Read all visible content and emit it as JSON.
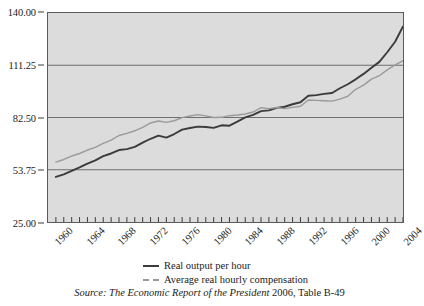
{
  "chart_data": {
    "type": "line",
    "title": "",
    "subtitle": "",
    "xlabel": "",
    "ylabel": "",
    "xlim": [
      1959,
      2004
    ],
    "ylim": [
      25.0,
      140.0
    ],
    "grid": true,
    "grid_axis": "y",
    "legend_position": "below-plot-center",
    "y_ticks": [
      "140.00",
      "111.25",
      "82.50",
      "53.75",
      "25.00"
    ],
    "y_tick_values": [
      140.0,
      111.25,
      82.5,
      53.75,
      25.0
    ],
    "x_ticks": [
      "1960",
      "1964",
      "1968",
      "1972",
      "1976",
      "1980",
      "1984",
      "1988",
      "1992",
      "1996",
      "2000",
      "2004"
    ],
    "x_tick_values": [
      1960,
      1964,
      1968,
      1972,
      1976,
      1980,
      1984,
      1988,
      1992,
      1996,
      2000,
      2004
    ],
    "x_minor_tick_interval": 1,
    "x": [
      1960,
      1961,
      1962,
      1963,
      1964,
      1965,
      1966,
      1967,
      1968,
      1969,
      1970,
      1971,
      1972,
      1973,
      1974,
      1975,
      1976,
      1977,
      1978,
      1979,
      1980,
      1981,
      1982,
      1983,
      1984,
      1985,
      1986,
      1987,
      1988,
      1989,
      1990,
      1991,
      1992,
      1993,
      1994,
      1995,
      1996,
      1997,
      1998,
      1999,
      2000,
      2001,
      2002,
      2003,
      2004
    ],
    "series": [
      {
        "name": "Real output per hour",
        "color": "#3b3b3b",
        "style": "solid",
        "values": [
          49.8,
          51.2,
          53.1,
          55.0,
          57.1,
          58.9,
          61.2,
          62.7,
          64.6,
          65.1,
          66.3,
          68.7,
          70.8,
          72.5,
          71.4,
          73.4,
          75.8,
          76.7,
          77.5,
          77.3,
          76.8,
          78.2,
          78.0,
          80.2,
          82.6,
          83.9,
          86.0,
          86.4,
          87.8,
          88.4,
          89.8,
          90.9,
          94.5,
          94.8,
          95.5,
          96.0,
          98.6,
          100.8,
          103.5,
          106.5,
          109.9,
          113.1,
          118.4,
          124.2,
          132.6
        ]
      },
      {
        "name": "Average real hourly compensation",
        "color": "#9a9a9a",
        "style": "solid-light",
        "values": [
          57.9,
          59.4,
          61.3,
          62.7,
          64.6,
          66.1,
          68.3,
          70.0,
          72.6,
          73.8,
          75.2,
          77.1,
          79.5,
          80.6,
          79.8,
          80.7,
          82.4,
          83.3,
          84.1,
          83.4,
          82.5,
          82.6,
          83.5,
          83.9,
          84.4,
          85.5,
          87.9,
          87.4,
          88.0,
          87.4,
          88.1,
          88.7,
          92.1,
          91.9,
          91.7,
          91.5,
          92.6,
          94.2,
          98.0,
          100.3,
          103.6,
          105.5,
          108.7,
          111.5,
          113.8
        ]
      }
    ]
  },
  "legend": {
    "items": [
      {
        "label": "Real output per hour",
        "swatch": "solid-dark-line"
      },
      {
        "label": "Average real hourly compensation",
        "swatch": "dashed-gray-line"
      }
    ]
  },
  "source_note": {
    "prefix_italic": "Source: The Economic Report of the President",
    "suffix_roman": " 2006, Table B-49"
  }
}
